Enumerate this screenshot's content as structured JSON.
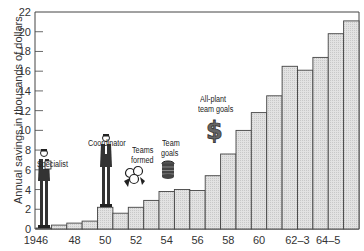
{
  "chart_data": {
    "type": "bar",
    "title": "",
    "xlabel": "",
    "ylabel": "Annual savings in thousands of dollars",
    "ylim": [
      0,
      22
    ],
    "yticks": [
      0,
      2,
      4,
      6,
      8,
      10,
      12,
      14,
      16,
      18,
      20,
      22
    ],
    "xtick_labels": [
      "1946",
      "48",
      "50",
      "52",
      "54",
      "56",
      "58",
      "60",
      "62–3",
      "64–5"
    ],
    "grid": false,
    "legend": null,
    "categories": [
      "1946",
      "1947",
      "1948",
      "1949",
      "1950",
      "1951",
      "1952",
      "1953",
      "1954",
      "1955",
      "1956",
      "1957",
      "1958",
      "1959",
      "1960",
      "1961",
      "1962",
      "1963",
      "1964",
      "1965",
      "1966"
    ],
    "values": [
      0.1,
      0.4,
      0.6,
      0.8,
      2.2,
      1.6,
      2.2,
      2.9,
      3.8,
      4.0,
      3.9,
      5.4,
      7.6,
      10.0,
      11.8,
      13.5,
      16.5,
      16.1,
      17.4,
      19.8,
      21.1
    ],
    "annotations": [
      {
        "label": "Specialist",
        "year": "1946",
        "icon": "man-with-clipboard-icon"
      },
      {
        "label": "Coordinator",
        "year": "1950",
        "icon": "standing-man-icon"
      },
      {
        "label": "Teams formed",
        "year": "1952",
        "icon": "group-of-people-icon"
      },
      {
        "label": "Team goals",
        "year": "1954",
        "icon": "stack-of-coins-icon"
      },
      {
        "label": "All-plant team goals",
        "year": "1957",
        "icon": "dollar-sign-icon"
      }
    ],
    "colors": {
      "bar_fill": "#dcdcdc",
      "bar_edge": "#444444",
      "axis": "#444444"
    }
  },
  "labels": {
    "ylabel": "Annual savings in thousands of dollars",
    "ann_specialist": "Specialist",
    "ann_coordinator": "Coordinator",
    "ann_teams_1": "Teams",
    "ann_teams_2": "formed",
    "ann_goals_1": "Team",
    "ann_goals_2": "goals",
    "ann_allplant_1": "All-plant",
    "ann_allplant_2": "team goals"
  }
}
